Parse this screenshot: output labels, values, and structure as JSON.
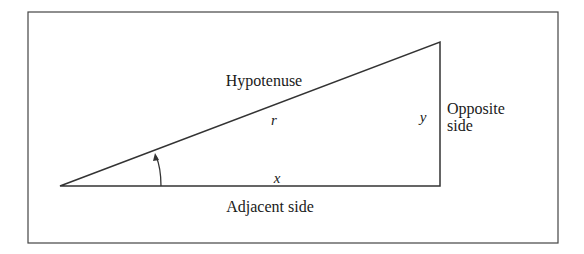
{
  "diagram": {
    "type": "right-triangle",
    "labels": {
      "hypotenuse": "Hypotenuse",
      "r": "r",
      "y": "y",
      "opposite_line1": "Opposite",
      "opposite_line2": "side",
      "x": "x",
      "adjacent": "Adjacent side"
    },
    "colors": {
      "stroke": "#333333",
      "text": "#1a1a1a"
    }
  }
}
